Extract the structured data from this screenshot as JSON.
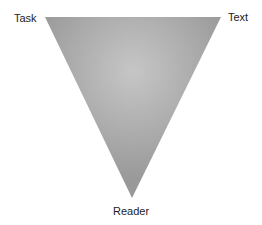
{
  "diagram": {
    "type": "inverted-triangle",
    "vertices": [
      {
        "label": "Task",
        "position": "top-left"
      },
      {
        "label": "Text",
        "position": "top-right"
      },
      {
        "label": "Reader",
        "position": "bottom"
      }
    ],
    "colors": {
      "fill_center": "#c6c6c6",
      "fill_edge": "#999999",
      "label": "#222222",
      "background": "#ffffff"
    }
  }
}
